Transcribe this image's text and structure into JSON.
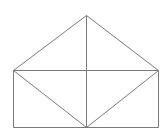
{
  "diagram": {
    "stroke_color": "#7a7a7a",
    "background": "#ffffff",
    "points": {
      "apex": [
        86,
        15
      ],
      "left_top": [
        13,
        70
      ],
      "right_top": [
        158,
        70
      ],
      "left_bottom": [
        13,
        127
      ],
      "right_bottom": [
        158,
        127
      ],
      "center_bottom": [
        86,
        127
      ]
    },
    "segments": [
      {
        "name": "roof-left",
        "from": "apex",
        "to": "left_top"
      },
      {
        "name": "roof-right",
        "from": "apex",
        "to": "right_top"
      },
      {
        "name": "horizontal-mid",
        "from": "left_top",
        "to": "right_top"
      },
      {
        "name": "rect-left",
        "from": "left_top",
        "to": "left_bottom"
      },
      {
        "name": "rect-right",
        "from": "right_top",
        "to": "right_bottom"
      },
      {
        "name": "rect-bottom",
        "from": "left_bottom",
        "to": "right_bottom"
      },
      {
        "name": "center-vertical",
        "from": "apex",
        "to": "center_bottom"
      },
      {
        "name": "diag-left",
        "from": "left_top",
        "to": "center_bottom"
      },
      {
        "name": "diag-right",
        "from": "right_top",
        "to": "center_bottom"
      }
    ]
  }
}
